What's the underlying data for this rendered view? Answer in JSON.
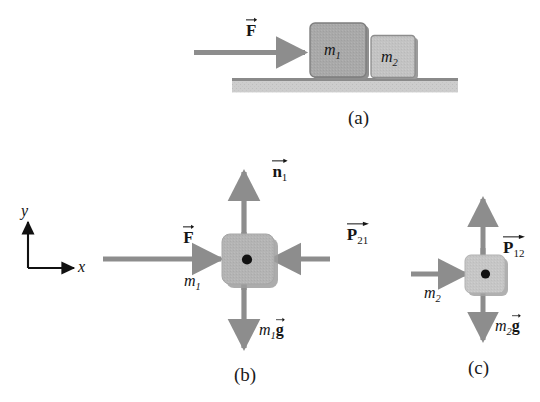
{
  "figure": {
    "colors": {
      "arrow_gray": "#8d8d8d",
      "block_fill_dark": "#a9a9a9",
      "block_fill_light": "#c3c3c3",
      "block_edge": "#7b7b7b",
      "ground_top": "#8e8e8e",
      "ground_body": "#c9c9c9",
      "axis_black": "#111111",
      "dot_black": "#111111",
      "text_black": "#151515"
    }
  },
  "panels": [
    {
      "id": "a",
      "tag": "(a)",
      "caption": "Two blocks in contact on a horizontal surface pushed by F",
      "blocks": [
        {
          "name": "block-m1",
          "label_m": "m",
          "label_sub": "1"
        },
        {
          "name": "block-m2",
          "label_m": "m",
          "label_sub": "2"
        }
      ],
      "vectors": [
        {
          "name": "applied-force",
          "symbol": "F",
          "sub": "",
          "direction": "right"
        }
      ],
      "ground": {
        "name": "ground-surface"
      }
    },
    {
      "id": "b",
      "tag": "(b)",
      "caption": "Free-body diagram of block m1",
      "mass_label": {
        "m": "m",
        "sub": "1"
      },
      "vectors": [
        {
          "name": "normal-force-n1",
          "symbol": "n",
          "sub": "1",
          "direction": "up"
        },
        {
          "name": "applied-force-F",
          "symbol": "F",
          "sub": "",
          "direction": "right"
        },
        {
          "name": "contact-force-P21",
          "symbol": "P",
          "sub": "21",
          "direction": "left"
        },
        {
          "name": "weight-m1g",
          "symbol": "g",
          "sub": "",
          "prefix_m": "m",
          "prefix_sub": "1",
          "direction": "down"
        }
      ]
    },
    {
      "id": "c",
      "tag": "(c)",
      "caption": "Free-body diagram of block m2",
      "mass_label": {
        "m": "m",
        "sub": "2"
      },
      "vectors": [
        {
          "name": "normal-force-n2",
          "symbol": "n",
          "sub": "2",
          "direction": "up"
        },
        {
          "name": "contact-force-P12",
          "symbol": "P",
          "sub": "12",
          "direction": "right"
        },
        {
          "name": "weight-m2g",
          "symbol": "g",
          "sub": "",
          "prefix_m": "m",
          "prefix_sub": "2",
          "direction": "down"
        }
      ]
    }
  ],
  "axes": {
    "name": "coordinate-axes",
    "x_label": "x",
    "y_label": "y"
  },
  "labels": {
    "panel_a_tag": "(a)",
    "panel_b_tag": "(b)",
    "panel_c_tag": "(c)",
    "m1": "m",
    "m1_sub": "1",
    "m2": "m",
    "m2_sub": "2",
    "F": "F",
    "n": "n",
    "n1_sub": "1",
    "n2_sub": "2",
    "P": "P",
    "P21_sub": "21",
    "P12_sub": "12",
    "g": "g",
    "x": "x",
    "y": "y"
  }
}
